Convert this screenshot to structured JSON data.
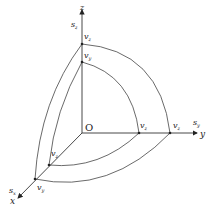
{
  "diagram": {
    "origin_label": "O",
    "axes": {
      "z": {
        "label": "z",
        "sub_label_base": "s",
        "sub_label_sub": "z"
      },
      "y": {
        "label": "y",
        "sub_label_base": "s",
        "sub_label_sub": "y"
      },
      "x": {
        "label": "x",
        "sub_label_base": "s",
        "sub_label_sub": "x"
      }
    },
    "points": {
      "z_outer": {
        "base": "v",
        "sub": "z"
      },
      "z_inner": {
        "base": "v",
        "sub": "y"
      },
      "y_inner": {
        "base": "v",
        "sub": "z"
      },
      "y_outer": {
        "base": "v",
        "sub": "z"
      },
      "x_inner": {
        "base": "v",
        "sub": "z"
      },
      "x_outer": {
        "base": "v",
        "sub": "y"
      }
    }
  }
}
